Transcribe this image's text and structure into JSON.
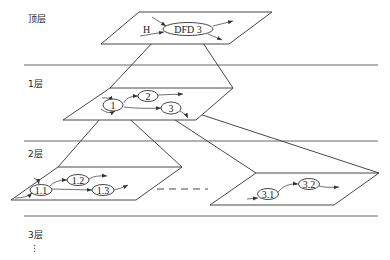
{
  "diagram": {
    "layers": [
      {
        "id": "top",
        "label": "顶层"
      },
      {
        "id": "l1",
        "label": "1层"
      },
      {
        "id": "l2",
        "label": "2层"
      },
      {
        "id": "l3",
        "label": "3层"
      }
    ],
    "continuation": "⋮",
    "top_plane": {
      "source_label": "H",
      "process": "DFD 3"
    },
    "level1_plane": {
      "processes": [
        "1",
        "2",
        "3"
      ]
    },
    "level2_left_plane": {
      "processes": [
        "1.1",
        "1.2",
        "1.3"
      ]
    },
    "level2_right_plane": {
      "processes": [
        "3.1",
        "3.2"
      ]
    },
    "colors": {
      "line": "#333333",
      "background": "#ffffff"
    }
  }
}
